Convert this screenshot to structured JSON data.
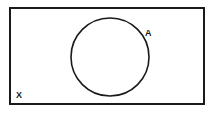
{
  "diagram": {
    "type": "venn",
    "background_color": "#ffffff",
    "stroke_color": "#1a1a1a",
    "label_color": "#1a1a1a",
    "universe": {
      "name": "universal-set",
      "label": "X",
      "shape": "rectangle",
      "x": 10,
      "y": 8,
      "width": 194,
      "height": 96,
      "stroke_width": 2,
      "label_x": 16,
      "label_y": 98,
      "label_font_size": 9
    },
    "sets": [
      {
        "name": "set-a",
        "label": "A",
        "shape": "circle",
        "cx": 110,
        "cy": 57,
        "r": 39,
        "stroke_width": 1.6,
        "label_x": 145,
        "label_y": 36,
        "label_font_size": 9
      }
    ]
  }
}
